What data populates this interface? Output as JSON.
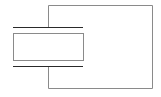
{
  "diagram": {
    "background": "#ffffff",
    "large_box": {
      "x": 48,
      "y": 5,
      "width": 104,
      "height": 83,
      "stroke": "#8a8a8a"
    },
    "small_box": {
      "x": 13,
      "y": 33,
      "width": 70,
      "height": 27,
      "stroke": "#8a8a8a"
    },
    "top_bar": {
      "x1": 13,
      "x2": 83,
      "y": 27,
      "stroke": "#2a2a2a"
    },
    "bottom_bar": {
      "x1": 13,
      "x2": 83,
      "y": 66,
      "stroke": "#2a2a2a"
    }
  }
}
